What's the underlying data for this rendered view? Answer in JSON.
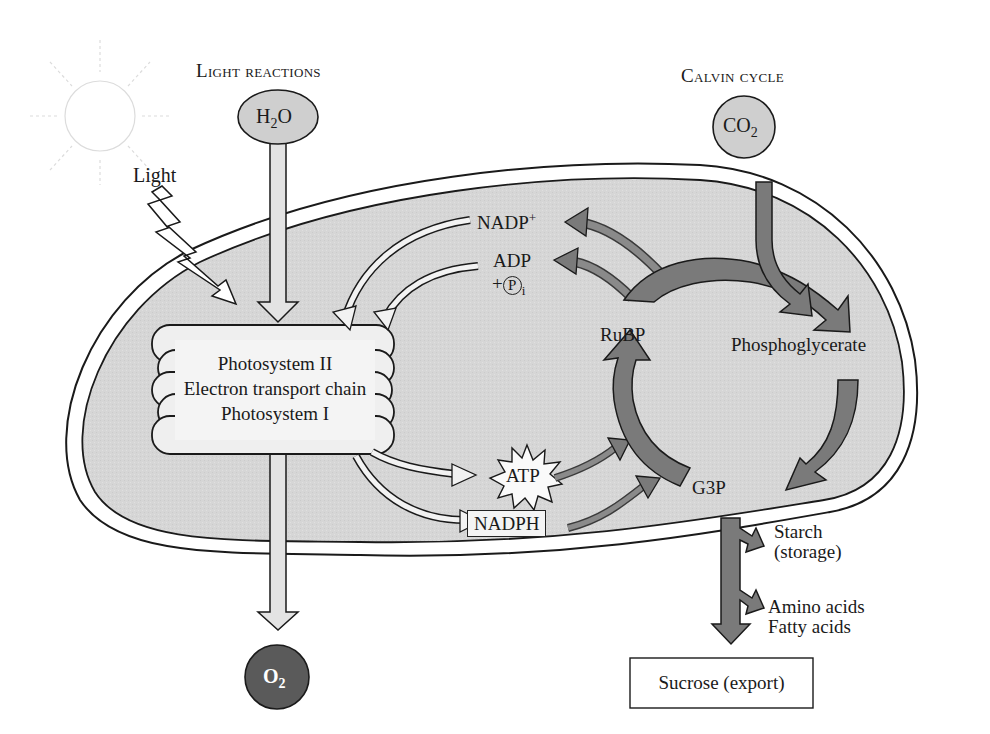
{
  "headers": {
    "light_reactions": "Light reactions",
    "calvin_cycle": "Calvin cycle"
  },
  "inputs": {
    "light": "Light",
    "water": {
      "base": "H",
      "sub": "2",
      "tail": "O"
    },
    "co2": {
      "base": "CO",
      "sub": "2"
    }
  },
  "outputs": {
    "oxygen": {
      "base": "O",
      "sub": "2"
    },
    "sucrose": "Sucrose (export)",
    "starch_line1": "Starch",
    "starch_line2": "(storage)",
    "amino": "Amino acids",
    "fatty": "Fatty acids"
  },
  "thylakoid": {
    "line1": "Photosystem II",
    "line2": "Electron transport chain",
    "line3": "Photosystem I"
  },
  "carriers": {
    "nadp": {
      "base": "NADP",
      "sup": "+"
    },
    "adp": "ADP",
    "pi_prefix": "+",
    "pi_symbol": "P",
    "pi_sub": "i",
    "atp": "ATP",
    "nadph": "NADPH"
  },
  "calvin": {
    "rubp": "RuBP",
    "phosphoglycerate": "Phosphoglycerate",
    "g3p": "G3P"
  },
  "colors": {
    "stroma": "#d9d9d9",
    "dark_arrow": "#7a7a7a",
    "light_arrow": "#e6e6e6",
    "oxygen_fill": "#5a5a5a",
    "input_fill": "#cfcfcf"
  }
}
